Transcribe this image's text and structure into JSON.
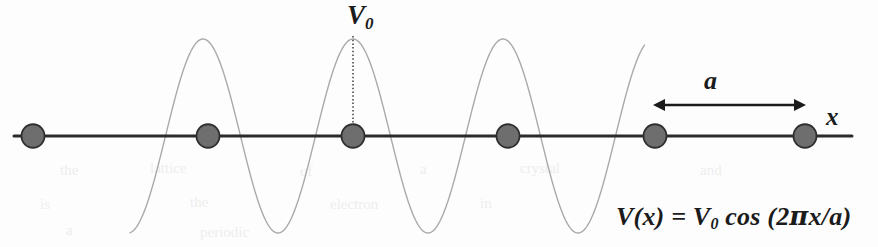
{
  "figure": {
    "background_color": "#fdfdfd"
  },
  "labels": {
    "amplitude": "V",
    "amplitude_subscript": "0",
    "lattice_constant": "a",
    "axis_x": "x"
  },
  "formula": {
    "lhs": "V(x) = V",
    "lhs_subscript": "0",
    "rhs_open": " cos (2",
    "pi": "π",
    "rhs_close": "x/a)",
    "full_text": "V(x) = V0 cos (2πx/a)"
  },
  "colors": {
    "atom_fill": "#6e6e6e",
    "atom_stroke": "#2f2f2f",
    "axis": "#2b2b2b",
    "wave": "#a9a9a9",
    "dotted_line": "#4a4a4a",
    "text": "#1b1b1b",
    "bleed_text": "#ededed"
  },
  "geometry": {
    "axis": {
      "y": 136,
      "x_start": 14,
      "x_end": 852,
      "stroke_width": 3
    },
    "atoms": [
      {
        "cx": 33,
        "cy": 136,
        "r": 11.5
      },
      {
        "cx": 208,
        "cy": 136,
        "r": 11.5
      },
      {
        "cx": 353,
        "cy": 136,
        "r": 11.5
      },
      {
        "cx": 508,
        "cy": 136,
        "r": 11.5
      },
      {
        "cx": 655,
        "cy": 136,
        "r": 11.5
      },
      {
        "cx": 805,
        "cy": 136,
        "r": 11.5
      }
    ],
    "wave": {
      "x_start": 130,
      "x_end": 645,
      "amplitude": 97,
      "period": 150,
      "crest_x": 353,
      "baseline_y": 136,
      "stroke_width": 1.4
    },
    "dotted_line": {
      "x": 353,
      "y_top": 36,
      "y_bottom": 132
    },
    "arrow": {
      "y": 105,
      "x_left": 653,
      "x_right": 806,
      "head": 9
    }
  },
  "chart_data": {
    "type": "line",
    "xlabel": "x",
    "ylabel": "V(x)",
    "function": "V(x) = V0 cos (2πx/a)",
    "amplitude_label": "V0",
    "period_label": "a",
    "atom_count": 6,
    "grid": false,
    "legend": null,
    "annotations": [
      "V0 marks the peak value of the potential at an atomic site",
      "a is the lattice constant, the spacing between adjacent atoms",
      "x is the horizontal position axis"
    ]
  },
  "bleed_through": [
    {
      "text": "the",
      "left": 60,
      "top": 162
    },
    {
      "text": "lattice",
      "left": 150,
      "top": 160
    },
    {
      "text": "of",
      "left": 300,
      "top": 163
    },
    {
      "text": "a",
      "left": 420,
      "top": 161
    },
    {
      "text": "crystal",
      "left": 520,
      "top": 160
    },
    {
      "text": "and",
      "left": 700,
      "top": 162
    },
    {
      "text": "is",
      "left": 40,
      "top": 196
    },
    {
      "text": "the",
      "left": 190,
      "top": 194
    },
    {
      "text": "electron",
      "left": 330,
      "top": 196
    },
    {
      "text": "in",
      "left": 480,
      "top": 195
    },
    {
      "text": "a",
      "left": 66,
      "top": 222
    },
    {
      "text": "periodic",
      "left": 200,
      "top": 224
    }
  ]
}
